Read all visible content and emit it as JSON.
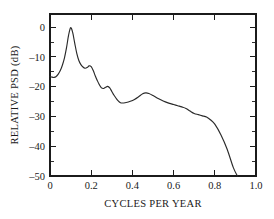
{
  "chart_data": {
    "type": "line",
    "title": "",
    "xlabel": "CYCLES PER YEAR",
    "ylabel": "RELATIVE PSD (dB)",
    "xlim": [
      0.0,
      1.0
    ],
    "ylim": [
      -50,
      4.4
    ],
    "grid": false,
    "legend": null,
    "xticks": [
      0.0,
      0.2,
      0.4,
      0.6,
      0.8,
      1.0
    ],
    "xticklabels": [
      "0",
      "0.2",
      "0.4",
      "0.6",
      "0.8",
      "1.0"
    ],
    "xticks_minor": [
      0.1,
      0.3,
      0.5,
      0.7,
      0.9
    ],
    "yticks": [
      0,
      -10,
      -20,
      -30,
      -40,
      -50
    ],
    "yticklabels": [
      "0",
      "–10",
      "–20",
      "–30",
      "–40",
      "–50"
    ],
    "yticks_minor": [
      -5,
      -15,
      -25,
      -35,
      -45
    ],
    "axes_box": true,
    "tick_direction": "in",
    "line_color": "#2a2a2a",
    "axis_color": "#1b1b1b",
    "background_color": "#ffffff",
    "series": [
      {
        "name": "Relative PSD",
        "x": [
          0.0,
          0.01,
          0.02,
          0.03,
          0.04,
          0.05,
          0.06,
          0.07,
          0.08,
          0.09,
          0.1,
          0.11,
          0.12,
          0.13,
          0.14,
          0.15,
          0.16,
          0.17,
          0.18,
          0.19,
          0.2,
          0.21,
          0.22,
          0.23,
          0.24,
          0.25,
          0.26,
          0.27,
          0.28,
          0.29,
          0.3,
          0.31,
          0.32,
          0.33,
          0.34,
          0.35,
          0.37,
          0.39,
          0.41,
          0.43,
          0.45,
          0.465,
          0.48,
          0.5,
          0.52,
          0.54,
          0.56,
          0.58,
          0.6,
          0.62,
          0.64,
          0.66,
          0.68,
          0.7,
          0.72,
          0.74,
          0.76,
          0.78,
          0.8,
          0.83,
          0.86,
          0.89,
          0.91
        ],
        "y": [
          -16.5,
          -16.8,
          -16.9,
          -16.6,
          -15.8,
          -14.6,
          -12.8,
          -10.4,
          -7.0,
          -2.8,
          -0.2,
          -1.8,
          -5.4,
          -8.8,
          -11.2,
          -12.6,
          -13.4,
          -13.8,
          -13.6,
          -13.0,
          -13.3,
          -14.6,
          -16.4,
          -18.0,
          -19.4,
          -20.4,
          -20.6,
          -20.2,
          -19.9,
          -20.4,
          -21.6,
          -22.8,
          -23.8,
          -24.7,
          -25.3,
          -25.5,
          -25.3,
          -24.9,
          -24.3,
          -23.4,
          -22.4,
          -22.1,
          -22.3,
          -23.0,
          -23.8,
          -24.5,
          -25.1,
          -25.6,
          -26.0,
          -26.4,
          -26.8,
          -27.3,
          -28.2,
          -29.0,
          -29.4,
          -29.8,
          -30.2,
          -31.2,
          -32.6,
          -36.2,
          -41.0,
          -47.2,
          -50.0
        ],
        "notes": {
          "start_value_db": -16.5,
          "peak_db": 0,
          "peak_frequency": 0.1,
          "secondary_peak_db": -13.8,
          "secondary_peak_frequency": 0.17,
          "third_peak_db": -19.9,
          "third_peak_frequency": 0.28,
          "broad_peak_db": -22.1,
          "broad_peak_frequency": 0.465,
          "floor_crossing_frequency": 0.91
        }
      }
    ]
  },
  "axis_titles": {
    "x": "CYCLES PER YEAR",
    "y": "RELATIVE PSD (dB)"
  }
}
